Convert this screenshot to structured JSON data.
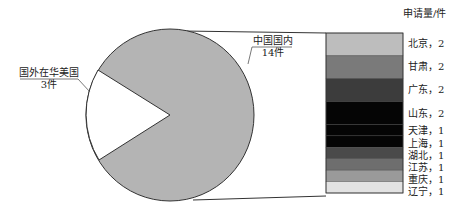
{
  "chart_data": {
    "type": "bar-of-pie",
    "title": "",
    "pie": {
      "slices": [
        {
          "label": "中国国内",
          "count_label": "14件",
          "value": 14,
          "color": "#b4b4b4"
        },
        {
          "label": "国外在华美国",
          "count_label": "3件",
          "value": 3,
          "color": "#ffffff"
        }
      ]
    },
    "bar": {
      "unit_label": "申请量/件",
      "categories": [
        "北京",
        "甘肃",
        "广东",
        "山东",
        "天津",
        "上海",
        "湖北",
        "江苏",
        "重庆",
        "辽宁"
      ],
      "values": [
        2,
        2,
        2,
        2,
        1,
        1,
        1,
        1,
        1,
        1
      ],
      "labels": [
        "北京，2",
        "甘肃，2",
        "广东，2",
        "山东，2",
        "天津，1",
        "上海，1",
        "湖北，1",
        "江苏，1",
        "重庆，1",
        "辽宁，1"
      ],
      "colors": [
        "#bdbdbd",
        "#7a7a7a",
        "#3c3c3c",
        "#050505",
        "#050505",
        "#050505",
        "#4a4a4a",
        "#6e6e6e",
        "#9a9a9a",
        "#e2e2e2"
      ],
      "total": 14
    }
  }
}
